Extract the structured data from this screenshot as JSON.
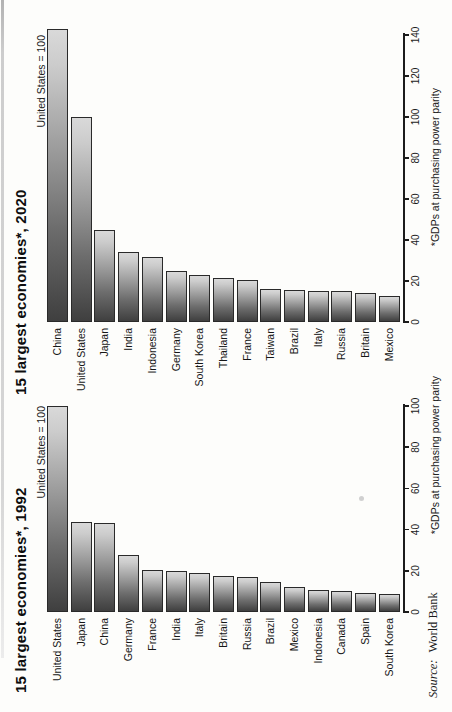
{
  "page": {
    "kind": "scanned book chart page",
    "rotation": "landscape chart rotated 90 degrees counter-clockwise"
  },
  "source": {
    "prefix": "Source:",
    "text": "World Bank"
  },
  "colors": {
    "ink": "#1b1b1b",
    "bar_dark": "#3f3f3f",
    "bar_light": "#d9d9d9",
    "bar_outline": "#2a2a2a",
    "paper": "#fdfdfb"
  },
  "chart_data": [
    {
      "type": "bar",
      "title": "15 largest economies*, 1992",
      "annotation": "United States = 100",
      "axis_note": "*GDPs at purchasing power parity",
      "xlabel": "GDP at purchasing power parity, United States = 100",
      "axis": {
        "min": 0,
        "max": 100,
        "tick_step": 20,
        "ticks": [
          0,
          20,
          40,
          60,
          80,
          100
        ]
      },
      "orientation": "horizontal bars, longest at top; page printed rotated",
      "categories": [
        "United States",
        "Japan",
        "China",
        "Germany",
        "France",
        "India",
        "Italy",
        "Britain",
        "Russia",
        "Brazil",
        "Mexico",
        "Indonesia",
        "Canada",
        "Spain",
        "South Korea"
      ],
      "values": [
        100,
        43.5,
        43,
        27.5,
        20.5,
        20,
        19,
        17.5,
        17,
        14.5,
        12,
        10.5,
        10,
        9,
        8.5
      ]
    },
    {
      "type": "bar",
      "title": "15 largest economies*, 2020",
      "annotation": "United States = 100",
      "axis_note": "*GDPs at purchasing power parity",
      "xlabel": "GDP at purchasing power parity, United States = 100",
      "axis": {
        "min": 0,
        "max": 140,
        "tick_step": 20,
        "ticks": [
          0,
          20,
          40,
          60,
          80,
          100,
          120,
          140
        ]
      },
      "orientation": "horizontal bars, longest at top; page printed rotated",
      "categories": [
        "China",
        "United States",
        "Japan",
        "India",
        "Indonesia",
        "Germany",
        "South Korea",
        "Thailand",
        "France",
        "Taiwan",
        "Brazil",
        "Italy",
        "Russia",
        "Britain",
        "Mexico"
      ],
      "values": [
        143,
        100,
        45,
        34,
        31.5,
        25,
        23,
        21.5,
        20.5,
        16,
        15.5,
        15,
        15,
        14,
        12.5
      ]
    }
  ]
}
